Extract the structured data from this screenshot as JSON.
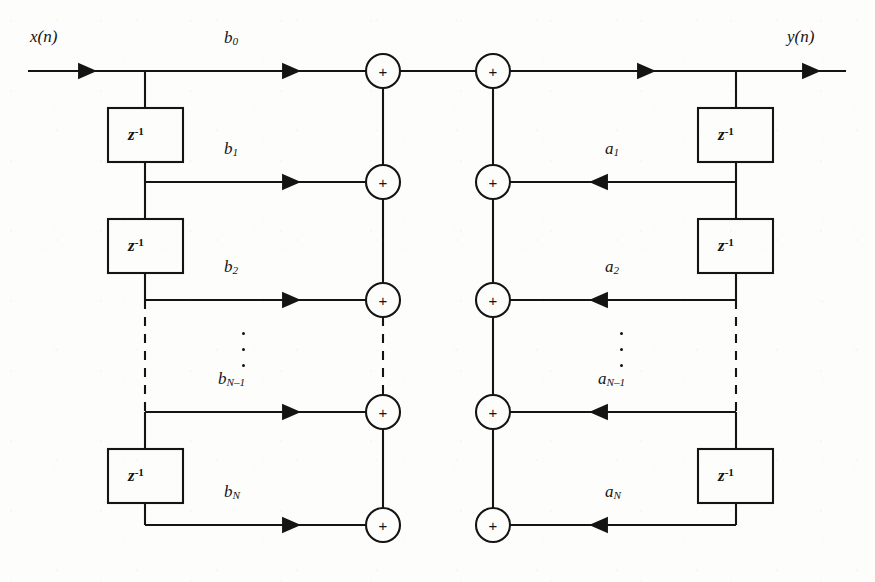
{
  "figure": {
    "kind": "signal-flow-graph",
    "name": "Direct Form I IIR filter structure",
    "background_color": "#fdfdfc",
    "line_color": "#141414"
  },
  "io": {
    "input_label": "x(n)",
    "output_label": "y(n)"
  },
  "delay": {
    "symbol_base": "z",
    "symbol_exponent": "-1",
    "feedforward_count": 4,
    "feedback_count": 3
  },
  "adders": {
    "symbol": "+",
    "left_column_count": 5,
    "right_column_count": 5
  },
  "feedforward": {
    "title": "feedforward coefficients",
    "taps": [
      {
        "base": "b",
        "sub": "0"
      },
      {
        "base": "b",
        "sub": "1"
      },
      {
        "base": "b",
        "sub": "2"
      },
      {
        "base": "b",
        "sub": "N–1"
      },
      {
        "base": "b",
        "sub": "N"
      }
    ]
  },
  "feedback": {
    "title": "feedback coefficients",
    "taps": [
      {
        "base": "a",
        "sub": "1"
      },
      {
        "base": "a",
        "sub": "2"
      },
      {
        "base": "a",
        "sub": "N–1"
      },
      {
        "base": "a",
        "sub": "N"
      }
    ]
  },
  "ellipsis": {
    "glyph": "⋮",
    "locations": [
      "feedforward-taps",
      "feedback-taps",
      "feedforward-delays",
      "feedback-delays",
      "left-adders",
      "right-adders"
    ]
  }
}
